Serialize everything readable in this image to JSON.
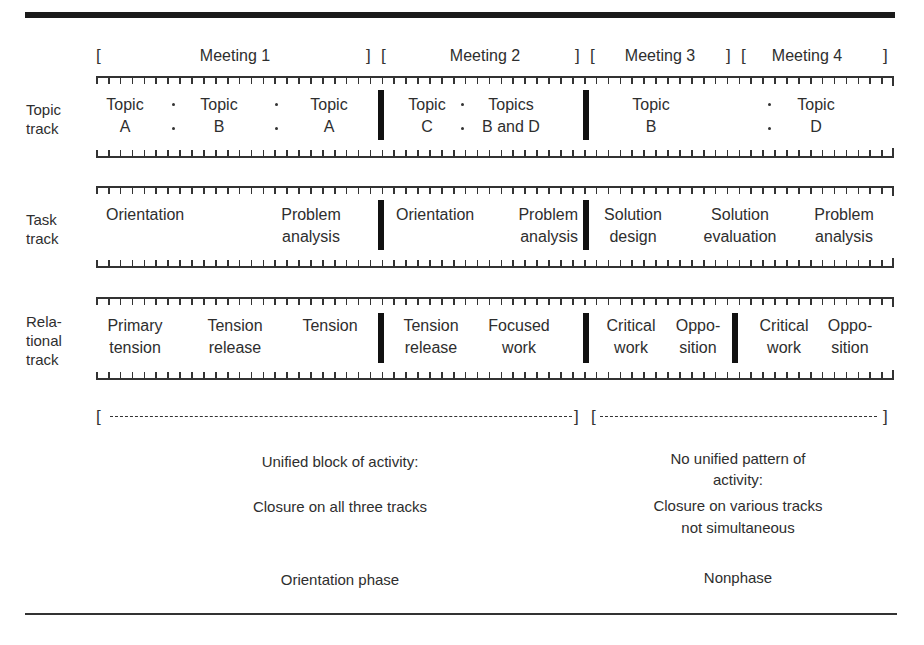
{
  "meetings": [
    {
      "label": "Meeting 1"
    },
    {
      "label": "Meeting 2"
    },
    {
      "label": "Meeting 3"
    },
    {
      "label": "Meeting 4"
    }
  ],
  "tracks": {
    "topic": {
      "label_line1": "Topic",
      "label_line2": "track",
      "cells": [
        {
          "line1": "Topic",
          "line2": "A"
        },
        {
          "line1": "Topic",
          "line2": "B"
        },
        {
          "line1": "Topic",
          "line2": "A"
        },
        {
          "line1": "Topic",
          "line2": "C"
        },
        {
          "line1": "Topics",
          "line2": "B and D"
        },
        {
          "line1": "Topic",
          "line2": "B"
        },
        {
          "line1": "Topic",
          "line2": "D"
        }
      ]
    },
    "task": {
      "label_line1": "Task",
      "label_line2": "track",
      "cells": [
        {
          "line1": "Orientation",
          "line2": ""
        },
        {
          "line1": "Problem",
          "line2": "analysis"
        },
        {
          "line1": "Orientation",
          "line2": ""
        },
        {
          "line1": "Problem",
          "line2": "analysis"
        },
        {
          "line1": "Solution",
          "line2": "design"
        },
        {
          "line1": "Solution",
          "line2": "evaluation"
        },
        {
          "line1": "Problem",
          "line2": "analysis"
        }
      ]
    },
    "relational": {
      "label_line1": "Rela-",
      "label_line2": "tional",
      "label_line3": "track",
      "cells": [
        {
          "line1": "Primary",
          "line2": "tension"
        },
        {
          "line1": "Tension",
          "line2": "release"
        },
        {
          "line1": "Tension",
          "line2": ""
        },
        {
          "line1": "Tension",
          "line2": "release"
        },
        {
          "line1": "Focused",
          "line2": "work"
        },
        {
          "line1": "Critical",
          "line2": "work"
        },
        {
          "line1": "Oppo-",
          "line2": "sition"
        },
        {
          "line1": "Critical",
          "line2": "work"
        },
        {
          "line1": "Oppo-",
          "line2": "sition"
        }
      ]
    }
  },
  "phases": {
    "left": {
      "bracket_open": "[",
      "dashes": "-------------------------------------------------------",
      "bracket_close": "]",
      "line1": "Unified block of activity:",
      "line2": "Closure on all three tracks",
      "phase_name": "Orientation phase"
    },
    "right": {
      "bracket_open": "[",
      "dashes": "---------------------------------",
      "bracket_close": "]",
      "line1": "No unified pattern of",
      "line2": "activity:",
      "line3": "Closure on various tracks",
      "line4": "not simultaneous",
      "phase_name": "Nonphase"
    }
  },
  "brackets": {
    "open": "[",
    "close": "]"
  }
}
